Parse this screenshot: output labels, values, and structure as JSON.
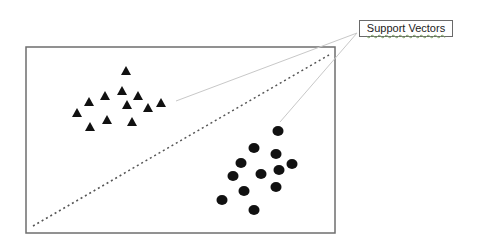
{
  "diagram": {
    "label": "Support Vectors",
    "frame": {
      "x1": 26,
      "y1": 47,
      "x2": 335,
      "y2": 233,
      "color": "#6e6e6e"
    },
    "hyperplane": {
      "x1": 33,
      "y1": 226,
      "x2": 329,
      "y2": 55,
      "style": "dotted",
      "color": "#555555"
    },
    "pointer_lines": [
      {
        "x1": 357,
        "y1": 33,
        "x2": 176,
        "y2": 101
      },
      {
        "x1": 357,
        "y1": 33,
        "x2": 280,
        "y2": 122
      }
    ],
    "class_a": {
      "shape": "triangle",
      "color": "#111111",
      "points": [
        [
          126,
          71
        ],
        [
          122,
          91
        ],
        [
          105,
          96
        ],
        [
          138,
          96
        ],
        [
          89,
          102
        ],
        [
          127,
          105
        ],
        [
          161,
          103
        ],
        [
          148,
          108
        ],
        [
          77,
          113
        ],
        [
          107,
          120
        ],
        [
          132,
          122
        ],
        [
          90,
          127
        ]
      ]
    },
    "class_b": {
      "shape": "circle",
      "color": "#111111",
      "points": [
        [
          278,
          131
        ],
        [
          254,
          148
        ],
        [
          276,
          154
        ],
        [
          241,
          163
        ],
        [
          292,
          164
        ],
        [
          279,
          170
        ],
        [
          261,
          174
        ],
        [
          233,
          176
        ],
        [
          276,
          187
        ],
        [
          244,
          191
        ],
        [
          222,
          200
        ],
        [
          254,
          210
        ]
      ]
    }
  }
}
